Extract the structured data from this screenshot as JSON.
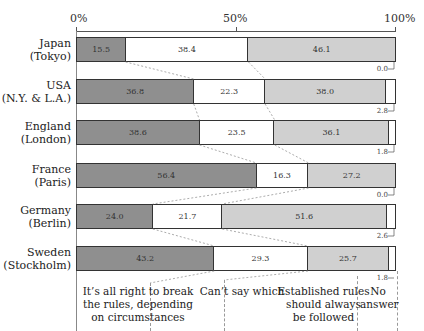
{
  "chart_data": {
    "type": "bar",
    "orientation": "horizontal-stacked-100",
    "title": "",
    "xlabel": "",
    "ylabel": "",
    "xlim": [
      0,
      100
    ],
    "x_ticks": [
      "0%",
      "50%",
      "100%"
    ],
    "categories": [
      "Japan (Tokyo)",
      "USA (N.Y. & L.A.)",
      "England (London)",
      "France (Paris)",
      "Germany (Berlin)",
      "Sweden (Stockholm)"
    ],
    "series": [
      {
        "name": "It's all right to break the rules, depending on circumstances",
        "color": "#8f8f8f",
        "values": [
          15.5,
          36.8,
          38.6,
          56.4,
          24.0,
          43.2
        ]
      },
      {
        "name": "Can't say which",
        "color": "#ffffff",
        "values": [
          38.4,
          22.3,
          23.5,
          16.3,
          21.7,
          29.3
        ]
      },
      {
        "name": "Established rules should always be followed",
        "color": "#d0d0d0",
        "values": [
          46.1,
          38.0,
          36.1,
          27.2,
          51.6,
          25.7
        ]
      },
      {
        "name": "No answer",
        "color": "#ffffff",
        "values": [
          0.0,
          2.8,
          1.8,
          0.0,
          2.6,
          1.8
        ]
      }
    ],
    "grid": false,
    "legend_position": "bottom"
  },
  "axis": {
    "t0": "0%",
    "t50": "50%",
    "t100": "100%"
  },
  "rows": [
    {
      "line1": "Japan",
      "line2": "(Tokyo)",
      "v": [
        "15.5",
        "38.4",
        "46.1"
      ],
      "na": "0.0"
    },
    {
      "line1": "USA",
      "line2": "(N.Y. & L.A.)",
      "v": [
        "36.8",
        "22.3",
        "38.0"
      ],
      "na": "2.8"
    },
    {
      "line1": "England",
      "line2": "(London)",
      "v": [
        "38.6",
        "23.5",
        "36.1"
      ],
      "na": "1.8"
    },
    {
      "line1": "France",
      "line2": "(Paris)",
      "v": [
        "56.4",
        "16.3",
        "27.2"
      ],
      "na": "0.0"
    },
    {
      "line1": "Germany",
      "line2": "(Berlin)",
      "v": [
        "24.0",
        "21.7",
        "51.6"
      ],
      "na": "2.6"
    },
    {
      "line1": "Sweden",
      "line2": "(Stockholm)",
      "v": [
        "43.2",
        "29.3",
        "25.7"
      ],
      "na": "1.8"
    }
  ],
  "legend": {
    "break_rules": [
      "It’s all right to break",
      "the rules, depending",
      "on circumstances"
    ],
    "cant_say": [
      "Can’t say which"
    ],
    "follow_rules": [
      "Established rules",
      "should always",
      "be followed"
    ],
    "no_answer": [
      "No",
      "answer"
    ]
  }
}
